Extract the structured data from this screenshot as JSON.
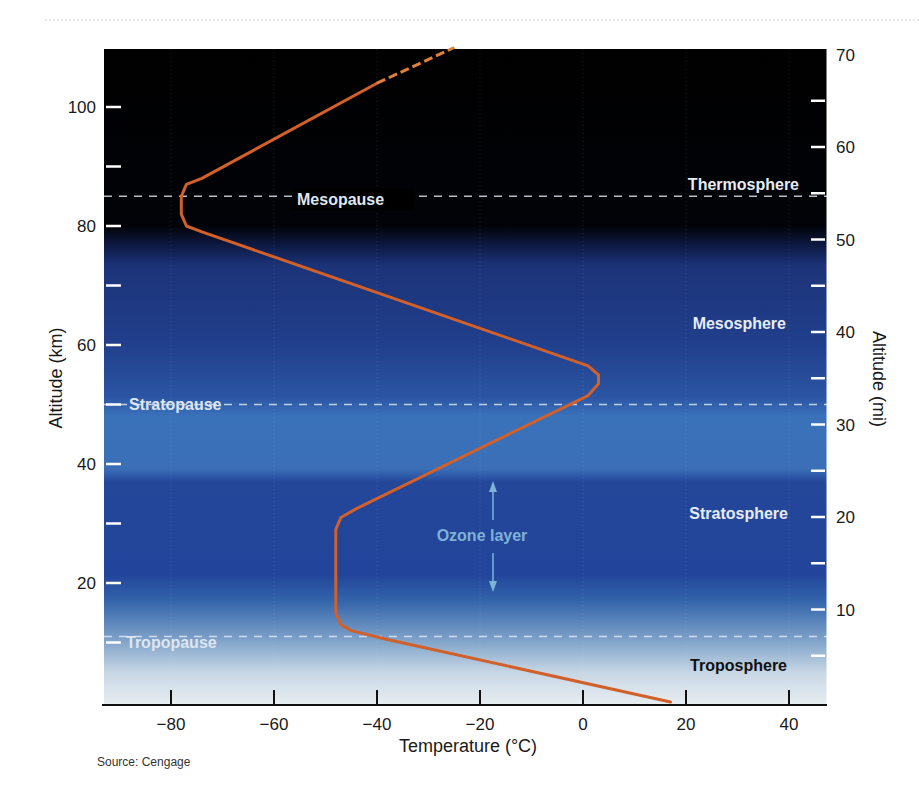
{
  "chart_data": {
    "type": "line",
    "title": "",
    "xlabel": "Temperature (°C)",
    "ylabel": "Altitude (km)",
    "y2label": "Altitude (mi)",
    "xlim": [
      -93,
      47
    ],
    "ylim": [
      0,
      110
    ],
    "y2lim": [
      0,
      70
    ],
    "x_ticks": [
      -80,
      -60,
      -40,
      -20,
      0,
      20,
      40
    ],
    "x_tick_labels": [
      "−80",
      "−60",
      "−40",
      "−20",
      "0",
      "20",
      "40"
    ],
    "y_ticks_labeled": [
      20,
      40,
      60,
      80,
      100
    ],
    "y_ticks_minor": [
      10,
      30,
      50,
      70,
      90
    ],
    "y2_ticks_labeled": [
      10,
      20,
      30,
      40,
      50,
      60,
      70
    ],
    "y2_ticks_minor": [
      5,
      15,
      25,
      35,
      45,
      55,
      65
    ],
    "grid": false,
    "series": [
      {
        "name": "Temperature profile",
        "color": "#d2602a",
        "points": [
          [
            17,
            0
          ],
          [
            -38,
            10.5
          ],
          [
            -45,
            12
          ],
          [
            -47,
            13
          ],
          [
            -48,
            15
          ],
          [
            -48,
            29
          ],
          [
            -47,
            31
          ],
          [
            -44,
            32.5
          ],
          [
            1,
            51.5
          ],
          [
            3,
            53.5
          ],
          [
            3,
            55
          ],
          [
            1,
            56.5
          ],
          [
            -74,
            79
          ],
          [
            -77,
            80
          ],
          [
            -78,
            82
          ],
          [
            -78,
            85
          ],
          [
            -77,
            87
          ],
          [
            -74,
            88
          ],
          [
            -40,
            104
          ]
        ],
        "dashed_extension": [
          [
            -40,
            104
          ],
          [
            -25,
            110
          ]
        ]
      }
    ],
    "boundaries": [
      {
        "name": "Tropopause",
        "altitude_km": 11
      },
      {
        "name": "Stratopause",
        "altitude_km": 50
      },
      {
        "name": "Mesopause",
        "altitude_km": 85
      }
    ],
    "layers": [
      {
        "name": "Troposphere",
        "label_altitude_km": 6
      },
      {
        "name": "Stratosphere",
        "label_altitude_km": 30
      },
      {
        "name": "Mesosphere",
        "label_altitude_km": 64
      },
      {
        "name": "Thermosphere",
        "label_altitude_km": 87
      }
    ],
    "annotations": [
      {
        "text": "Ozone layer",
        "range_km": [
          19,
          37
        ]
      }
    ],
    "source": "Source: Cengage"
  }
}
